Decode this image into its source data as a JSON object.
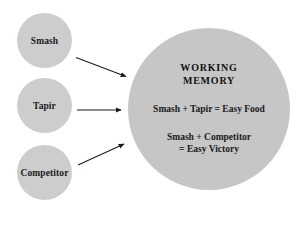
{
  "diagram": {
    "colors": {
      "source_node_fill": "#cdcdcd",
      "target_node_fill": "#c6c6c6",
      "text": "#1a1a1a",
      "arrow": "#1a1a1a",
      "background": "#ffffff"
    },
    "source_nodes": [
      {
        "id": "smash",
        "label": "Smash"
      },
      {
        "id": "tapir",
        "label": "Tapir"
      },
      {
        "id": "competitor",
        "label": "Competitor"
      }
    ],
    "target_node": {
      "id": "working-memory",
      "title_line_1": "WORKING",
      "title_line_2": "MEMORY",
      "equations": [
        {
          "id": "eq-food",
          "line_1": "Smash + Tapir = Easy Food"
        },
        {
          "id": "eq-victory",
          "line_1": "Smash + Competitor",
          "line_2": "= Easy Victory"
        }
      ]
    },
    "arrows": [
      {
        "id": "arrow-smash-to-wm",
        "from": "smash",
        "to": "working-memory"
      },
      {
        "id": "arrow-tapir-to-wm",
        "from": "tapir",
        "to": "working-memory"
      },
      {
        "id": "arrow-competitor-to-wm",
        "from": "competitor",
        "to": "working-memory"
      }
    ]
  }
}
